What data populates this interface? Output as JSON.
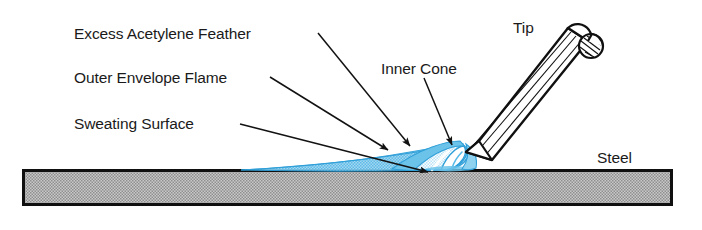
{
  "diagram": {
    "labels": {
      "excess_acetylene_feather": "Excess Acetylene Feather",
      "outer_envelope_flame": "Outer Envelope Flame",
      "sweating_surface": "Sweating Surface",
      "inner_cone": "Inner Cone",
      "tip": "Tip",
      "steel": "Steel"
    },
    "colors": {
      "flame_blue": "#52b5e5",
      "flame_blue_light": "#a8daf2",
      "flame_outline": "#2f9fd8",
      "steel_fill": "#b3b3b3",
      "steel_border": "#111111",
      "text": "#1a1a1a",
      "leader": "#121212",
      "torch_body": "#ffffff",
      "torch_outline": "#101010",
      "background": "#ffffff"
    },
    "parts": [
      {
        "name": "torch-tip",
        "description": "Tapered cylindrical welding torch tip angled about 40 degrees from horizontal, pointing down-left toward the steel plate"
      },
      {
        "name": "inner-cone",
        "description": "Small bright teardrop cone at the torch nozzle"
      },
      {
        "name": "excess-acetylene-feather",
        "description": "Feather shaped zone surrounding the inner cone"
      },
      {
        "name": "outer-envelope-flame",
        "description": "Large pale blue envelope sweeping left along the steel surface"
      },
      {
        "name": "sweating-surface",
        "description": "Region of the steel plate surface under the flame"
      },
      {
        "name": "steel-plate",
        "description": "Horizontal hatched rectangular steel bar"
      }
    ]
  }
}
